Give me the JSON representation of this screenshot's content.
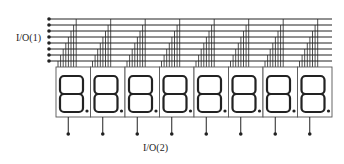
{
  "diagram": {
    "labels": {
      "io1": "I/O(1)",
      "io2": "I/O(2)"
    },
    "colors": {
      "line": "#222222",
      "background": "#ffffff",
      "display_border": "#555555"
    },
    "bus": {
      "line_count": 8,
      "x_start": 49,
      "x_end": 332,
      "y_top": 19,
      "spacing": 6
    },
    "displays": {
      "count": 8,
      "x_start": 56,
      "width": 34.5,
      "y_top": 67,
      "y_bottom": 117,
      "digit": "8.",
      "stem_bottom_y": 134
    }
  }
}
